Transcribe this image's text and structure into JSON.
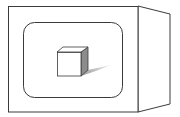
{
  "figure": {
    "colors": {
      "background": "#ffffff",
      "stroke": "#3a3a3a",
      "cube_side": "#8c8c8c",
      "shadow_dark": "#9a9a9a",
      "shadow_light": "#f0f0f0"
    }
  }
}
